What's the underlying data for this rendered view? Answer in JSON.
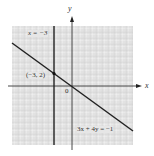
{
  "figure": {
    "axes": {
      "x_label": "x",
      "y_label": "y",
      "origin_label": "0"
    },
    "lines": [
      {
        "id": "vertical",
        "label": "x = −3",
        "equation": "x = -3"
      },
      {
        "id": "diagonal",
        "label": "3x + 4y = −1",
        "equation": "3x + 4y = -1"
      }
    ],
    "points": [
      {
        "label": "(−3, 2)",
        "x": -3,
        "y": 2
      }
    ],
    "colors": {
      "grid_bg": "#e4e4e4",
      "grid_minor": "#f6f6f6",
      "grid_major": "#c8c8c8",
      "line": "#222222"
    }
  }
}
